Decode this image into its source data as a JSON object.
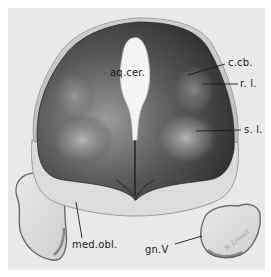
{
  "figure": {
    "type": "anatomical-illustration",
    "colors": {
      "background": "#ffffff",
      "plate": "#e9e9e9",
      "outer_rim": "#d2d2d2",
      "dark_tissue": "#3a3a3a",
      "mid_tissue": "#6e6e6e",
      "light_tissue": "#d9d9d9",
      "ventricle": "#f2f2f2",
      "label_text": "#1a1a1a"
    },
    "labels": [
      {
        "id": "aq_cer",
        "text": "aq.cer."
      },
      {
        "id": "c_cb",
        "text": "c.cb."
      },
      {
        "id": "r_l",
        "text": "r. l."
      },
      {
        "id": "s_l",
        "text": "s. l."
      },
      {
        "id": "med_obl",
        "text": "med.obl."
      },
      {
        "id": "gn_v",
        "text": "gn.V"
      }
    ],
    "signature": "R. Linnell"
  }
}
